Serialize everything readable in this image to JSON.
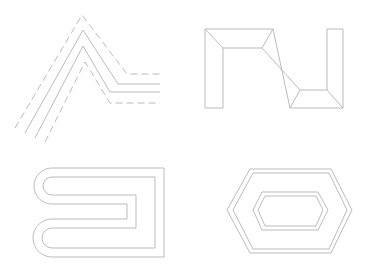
{
  "figure": {
    "stroke_color": "#b3b3b3",
    "background": "#ffffff",
    "panels": [
      {
        "id": "chevron-offsets",
        "label": "Chevron polyline with parallel offsets (outer and inner dashed)",
        "lines": [
          {
            "style": "dashed",
            "points": [
              [
                15,
                128
              ],
              [
                82,
                15
              ],
              [
                127,
                74
              ],
              [
                160,
                74
              ]
            ]
          },
          {
            "style": "solid",
            "points": [
              [
                25,
                133
              ],
              [
                83,
                30
              ],
              [
                118,
                84
              ],
              [
                160,
                84
              ]
            ]
          },
          {
            "style": "solid",
            "points": [
              [
                35,
                138
              ],
              [
                83,
                46
              ],
              [
                110,
                92
              ],
              [
                160,
                92
              ]
            ]
          },
          {
            "style": "dashed",
            "points": [
              [
                45,
                142
              ],
              [
                85,
                62
              ],
              [
                110,
                103
              ],
              [
                160,
                103
              ]
            ]
          }
        ]
      },
      {
        "id": "beveled-step-outline",
        "label": "Beveled stepped band outline",
        "outer": [
          [
            205,
            29
          ],
          [
            273,
            29
          ],
          [
            290,
            108
          ],
          [
            343,
            108
          ],
          [
            343,
            29
          ],
          [
            327,
            29
          ],
          [
            327,
            90
          ],
          [
            300,
            90
          ],
          [
            262,
            48
          ],
          [
            223,
            48
          ],
          [
            223,
            108
          ],
          [
            205,
            108
          ]
        ]
      },
      {
        "id": "serpentine-outline",
        "label": "Rounded serpentine band with inner offset",
        "outer_y": [
          168,
          204,
          219,
          257
        ],
        "inner_y": [
          177,
          195,
          228,
          248
        ],
        "x_right_outer": 164,
        "x_right_inner": 155,
        "x_notch_outer": 127,
        "x_notch_inner": 136
      },
      {
        "id": "nested-hexagons",
        "label": "Nested hexagon offsets",
        "hexagons": [
          [
            [
              227,
              210
            ],
            [
              250,
              169
            ],
            [
              331,
              169
            ],
            [
              352,
              210
            ],
            [
              331,
              253
            ],
            [
              250,
              253
            ]
          ],
          [
            [
              233,
              210
            ],
            [
              253,
              173
            ],
            [
              329,
              173
            ],
            [
              347,
              210
            ],
            [
              329,
              249
            ],
            [
              253,
              249
            ]
          ],
          [
            [
              253,
              210
            ],
            [
              262,
              192
            ],
            [
              318,
              192
            ],
            [
              328,
              210
            ],
            [
              318,
              230
            ],
            [
              262,
              230
            ]
          ],
          [
            [
              258,
              210
            ],
            [
              265,
              196
            ],
            [
              316,
              196
            ],
            [
              323,
              210
            ],
            [
              316,
              226
            ],
            [
              265,
              226
            ]
          ]
        ]
      }
    ]
  }
}
